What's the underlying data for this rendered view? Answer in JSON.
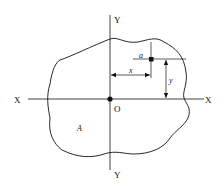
{
  "diagram": {
    "axes": {
      "x_left_label": "X",
      "x_right_label": "X",
      "y_top_label": "Y",
      "y_bottom_label": "Y",
      "origin_label": "O"
    },
    "area_label": "A",
    "element_label": "a",
    "dimension_x_label": "x",
    "dimension_y_label": "y",
    "colors": {
      "line": "#111111",
      "background": "#ffffff"
    }
  }
}
